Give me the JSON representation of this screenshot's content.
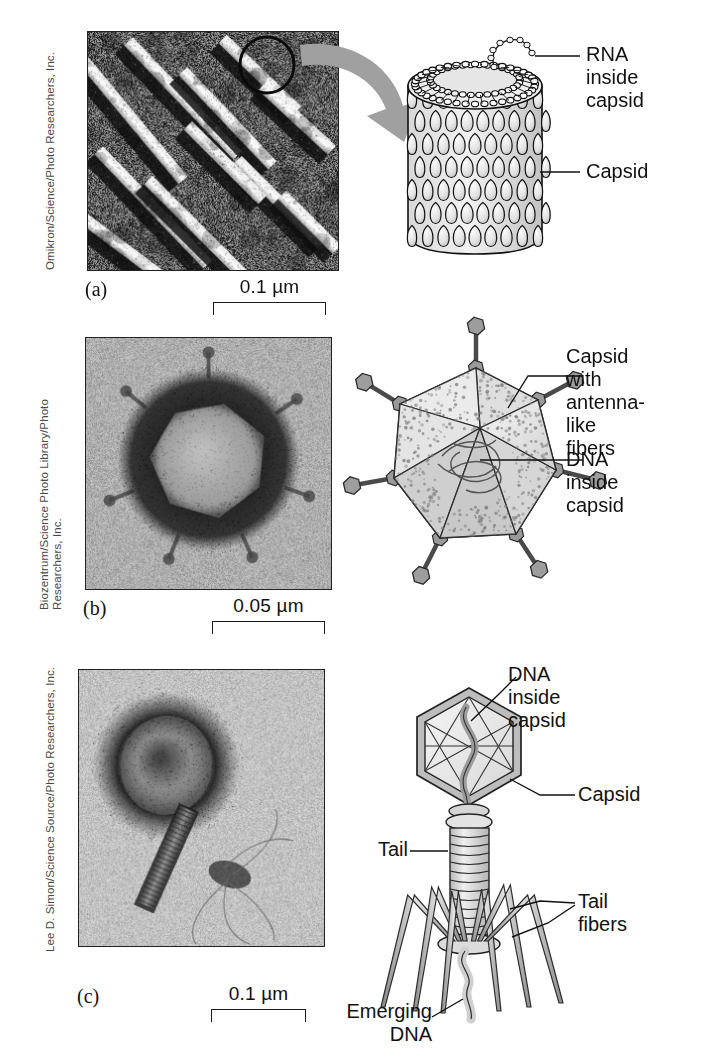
{
  "figure": {
    "background_color": "#ffffff",
    "ink_color": "#111111",
    "arrow_color": "#9d9d9d"
  },
  "panels": [
    {
      "id": "a",
      "letter": "(a)",
      "credit": [
        "Omikron/Science/Photo Researchers, Inc."
      ],
      "micrograph": {
        "name": "tobacco-mosaic-virus-micrograph",
        "style": "rod-shaped-helical-virus",
        "circle_annotation": true
      },
      "scale_bar": {
        "label": "0.1 µm"
      },
      "diagram": {
        "name": "helical-virus-diagram",
        "labels": [
          {
            "text": "RNA\ninside\ncapsid",
            "lines": [
              "RNA",
              "inside",
              "capsid"
            ]
          },
          {
            "text": "Capsid",
            "lines": [
              "Capsid"
            ]
          }
        ]
      },
      "arrow": {
        "from": "micrograph-circle",
        "to": "diagram"
      }
    },
    {
      "id": "b",
      "letter": "(b)",
      "credit": [
        "Biozentrum/Science Photo Library/Photo",
        "Researchers, Inc."
      ],
      "micrograph": {
        "name": "adenovirus-micrograph",
        "style": "icosahedral-virus-with-fibers",
        "circle_annotation": false
      },
      "scale_bar": {
        "label": "0.05 µm"
      },
      "diagram": {
        "name": "adenovirus-diagram",
        "labels": [
          {
            "text": "Capsid with\nantenna-like\nfibers",
            "lines": [
              "Capsid with",
              "antenna-like",
              "fibers"
            ]
          },
          {
            "text": "DNA inside\ncapsid",
            "lines": [
              "DNA inside",
              "capsid"
            ]
          }
        ]
      },
      "arrow": null
    },
    {
      "id": "c",
      "letter": "(c)",
      "credit": [
        "Lee D. Simon/Science Source/Photo Researchers, Inc."
      ],
      "micrograph": {
        "name": "bacteriophage-micrograph",
        "style": "tailed-bacteriophage",
        "circle_annotation": false
      },
      "scale_bar": {
        "label": "0.1 µm"
      },
      "diagram": {
        "name": "bacteriophage-diagram",
        "labels": [
          {
            "text": "DNA inside\ncapsid",
            "lines": [
              "DNA inside",
              "capsid"
            ]
          },
          {
            "text": "Capsid",
            "lines": [
              "Capsid"
            ]
          },
          {
            "text": "Tail",
            "lines": [
              "Tail"
            ]
          },
          {
            "text": "Tail\nfibers",
            "lines": [
              "Tail",
              "fibers"
            ]
          },
          {
            "text": "Emerging\nDNA",
            "lines": [
              "Emerging",
              "DNA"
            ]
          }
        ]
      },
      "arrow": null
    }
  ],
  "labels": {
    "a_rna_l1": "RNA",
    "a_rna_l2": "inside",
    "a_rna_l3": "capsid",
    "a_capsid": "Capsid",
    "b_fibers_l1": "Capsid with",
    "b_fibers_l2": "antenna-like",
    "b_fibers_l3": "fibers",
    "b_dna_l1": "DNA inside",
    "b_dna_l2": "capsid",
    "c_dna_l1": "DNA inside",
    "c_dna_l2": "capsid",
    "c_capsid": "Capsid",
    "c_tail": "Tail",
    "c_fibers_l1": "Tail",
    "c_fibers_l2": "fibers",
    "c_emerging_l1": "Emerging",
    "c_emerging_l2": "DNA"
  },
  "letters": {
    "a": "(a)",
    "b": "(b)",
    "c": "(c)"
  },
  "scales": {
    "a": "0.1 µm",
    "b": "0.05 µm",
    "c": "0.1 µm"
  },
  "credits": {
    "a": "Omikron/Science/Photo Researchers, Inc.",
    "b_l1": "Biozentrum/Science Photo Library/Photo",
    "b_l2": "Researchers, Inc.",
    "c": "Lee D. Simon/Science Source/Photo Researchers, Inc."
  }
}
